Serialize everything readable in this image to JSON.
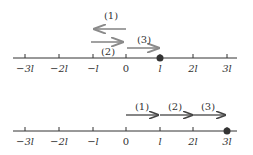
{
  "colors": {
    "axis": "#333333",
    "arrow_gray": "#8a8a8a",
    "arrow_dark": "#444444",
    "dot": "#333333"
  },
  "top_diagram": {
    "tick_labels": [
      "−3l",
      "−2l",
      "−l",
      "0",
      "l",
      "2l",
      "3l"
    ],
    "arrows": [
      {
        "label": "(1)",
        "from": "0",
        "to": "-l",
        "direction": "left"
      },
      {
        "label": "(2)",
        "from": "-l",
        "to": "0",
        "direction": "right"
      },
      {
        "label": "(3)",
        "from": "0",
        "to": "l",
        "direction": "right"
      }
    ],
    "particle_position": "l"
  },
  "bottom_diagram": {
    "tick_labels": [
      "−3l",
      "−2l",
      "−l",
      "0",
      "l",
      "2l",
      "3l"
    ],
    "arrows": [
      {
        "label": "(1)",
        "from": "0",
        "to": "l",
        "direction": "right"
      },
      {
        "label": "(2)",
        "from": "l",
        "to": "2l",
        "direction": "right"
      },
      {
        "label": "(3)",
        "from": "2l",
        "to": "3l",
        "direction": "right"
      }
    ],
    "particle_position": "3l"
  }
}
